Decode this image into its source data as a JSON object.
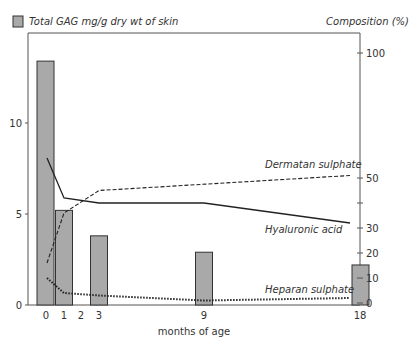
{
  "chart_data": {
    "type": "bar+line",
    "title_left": "Total GAG mg/g dry wt of skin",
    "title_right": "Composition (%)",
    "xlabel": "months of age",
    "x_ticks": [
      "0",
      "1",
      "2",
      "3",
      "9",
      "18"
    ],
    "left_axis": {
      "ticks": [
        "0",
        "5",
        "10"
      ],
      "ylim": [
        0,
        14.5
      ]
    },
    "right_axis": {
      "ticks": [
        "0",
        "10",
        "20",
        "30",
        "50",
        "100"
      ],
      "ylim": [
        0,
        100
      ]
    },
    "bars": {
      "name": "Total GAG mg/g dry wt of skin",
      "x": [
        0,
        1,
        3,
        9,
        18
      ],
      "values": [
        13.4,
        5.2,
        3.8,
        2.9,
        2.2
      ],
      "color": "#a9a9a9"
    },
    "series": [
      {
        "name": "Dermatan sulphate",
        "style": "dashed",
        "axis": "right",
        "x": [
          0,
          1,
          3,
          18
        ],
        "values": [
          16,
          36,
          45,
          51
        ]
      },
      {
        "name": "Hyaluronic acid",
        "style": "solid",
        "axis": "right",
        "x": [
          0,
          1,
          3,
          9,
          18
        ],
        "values": [
          58,
          42,
          40,
          40,
          32
        ]
      },
      {
        "name": "Heparan sulphate",
        "style": "dotted",
        "axis": "right",
        "x": [
          0,
          1,
          3,
          9,
          18
        ],
        "values": [
          10,
          4,
          3,
          1,
          2
        ]
      }
    ],
    "legend": {
      "position": "top-left",
      "entries": [
        "Total GAG mg/g dry wt of skin"
      ]
    },
    "grid": false
  }
}
